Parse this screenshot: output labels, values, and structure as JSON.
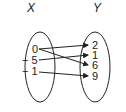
{
  "diagram": {
    "type": "mapping",
    "domain_label": "X",
    "range_label": "Y",
    "domain": [
      "0",
      "− 5",
      "− 1"
    ],
    "range": [
      "2",
      "1",
      "6",
      "9"
    ],
    "mappings": [
      {
        "from": "0",
        "to": "2"
      },
      {
        "from": "0",
        "to": "6"
      },
      {
        "from": "-5",
        "to": "1"
      },
      {
        "from": "-1",
        "to": "9"
      }
    ],
    "colors": {
      "stroke": "#222222",
      "background": "#ffffff"
    }
  }
}
